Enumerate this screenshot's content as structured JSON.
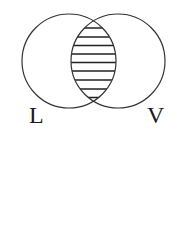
{
  "diagram": {
    "type": "venn",
    "sets": [
      {
        "id": "L",
        "label": "L"
      },
      {
        "id": "V",
        "label": "V"
      }
    ],
    "shaded_region": "L ∩ V",
    "shading_style": "horizontal-hatch",
    "colors": {
      "stroke": "#333333",
      "hatch": "#222222",
      "background": "#ffffff"
    }
  }
}
